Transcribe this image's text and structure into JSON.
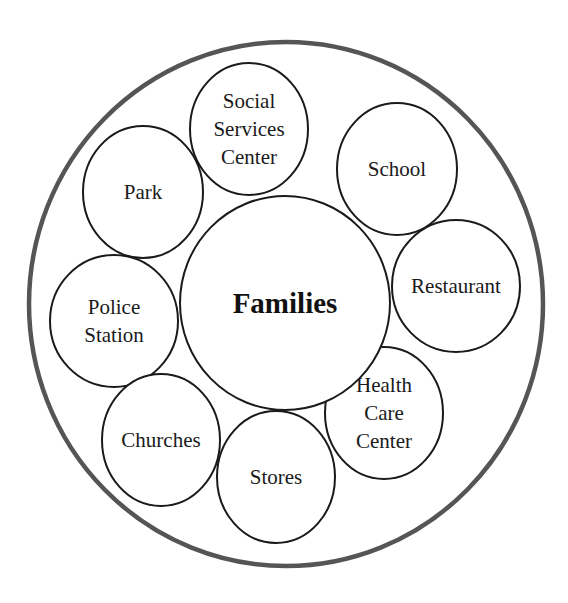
{
  "diagram": {
    "center": {
      "label": "Families",
      "cx": 285,
      "cy": 303,
      "rx": 105,
      "ry": 107
    },
    "outer": {
      "cx": 286,
      "cy": 304,
      "rx": 257,
      "ry": 262,
      "stroke": "#555555"
    },
    "nodes": [
      {
        "id": "social-services",
        "lines": [
          "Social",
          "Services",
          "Center"
        ],
        "cx": 249,
        "cy": 129,
        "rx": 59,
        "ry": 66
      },
      {
        "id": "school",
        "lines": [
          "School"
        ],
        "cx": 397,
        "cy": 169,
        "rx": 60,
        "ry": 66
      },
      {
        "id": "park",
        "lines": [
          "Park"
        ],
        "cx": 143,
        "cy": 192,
        "rx": 60,
        "ry": 66
      },
      {
        "id": "restaurant",
        "lines": [
          "Restaurant"
        ],
        "cx": 456,
        "cy": 286,
        "rx": 64,
        "ry": 66
      },
      {
        "id": "police-station",
        "lines": [
          "Police",
          "Station"
        ],
        "cx": 114,
        "cy": 321,
        "rx": 64,
        "ry": 66
      },
      {
        "id": "health-care-center",
        "lines": [
          "Health",
          "Care",
          "Center"
        ],
        "cx": 384,
        "cy": 413,
        "rx": 59,
        "ry": 66
      },
      {
        "id": "churches",
        "lines": [
          "Churches"
        ],
        "cx": 161,
        "cy": 440,
        "rx": 59,
        "ry": 66
      },
      {
        "id": "stores",
        "lines": [
          "Stores"
        ],
        "cx": 276,
        "cy": 477,
        "rx": 59,
        "ry": 66
      }
    ]
  }
}
